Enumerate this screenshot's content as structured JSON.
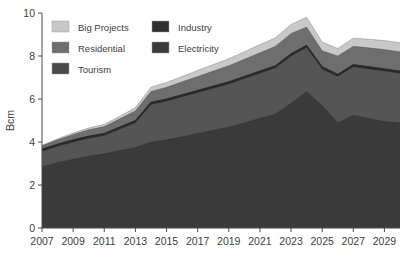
{
  "chart_data": {
    "type": "area",
    "stacked": true,
    "title": "",
    "xlabel": "",
    "ylabel": "Bcm",
    "ylim": [
      0,
      10
    ],
    "yticks": [
      0,
      2,
      4,
      6,
      8,
      10
    ],
    "ytick_labels": [
      "0",
      "2",
      "4",
      "6",
      "8",
      "10"
    ],
    "xlim": [
      2007,
      2030
    ],
    "xticks": [
      2007,
      2009,
      2011,
      2013,
      2015,
      2017,
      2019,
      2021,
      2023,
      2025,
      2027,
      2029
    ],
    "xtick_labels": [
      "2007",
      "2009",
      "2011",
      "2013",
      "2015",
      "2017",
      "2019",
      "2021",
      "2023",
      "2025",
      "2027",
      "2029"
    ],
    "x": [
      2007,
      2008,
      2009,
      2010,
      2011,
      2012,
      2013,
      2014,
      2015,
      2016,
      2017,
      2018,
      2019,
      2020,
      2021,
      2022,
      2023,
      2024,
      2025,
      2026,
      2027,
      2028,
      2029,
      2030
    ],
    "grid": false,
    "legend_position": "upper-left",
    "series": [
      {
        "name": "Electricity",
        "color": "#3a3a3a",
        "values": [
          2.85,
          3.05,
          3.2,
          3.35,
          3.45,
          3.6,
          3.75,
          4.0,
          4.1,
          4.25,
          4.4,
          4.55,
          4.7,
          4.9,
          5.1,
          5.3,
          5.8,
          6.35,
          5.7,
          4.9,
          5.25,
          5.1,
          4.95,
          4.9
        ]
      },
      {
        "name": "Tourism",
        "color": "#555555",
        "values": [
          0.72,
          0.75,
          0.8,
          0.82,
          0.85,
          1.0,
          1.15,
          1.75,
          1.8,
          1.85,
          1.9,
          1.95,
          2.0,
          2.05,
          2.1,
          2.15,
          2.2,
          2.05,
          1.7,
          2.15,
          2.25,
          2.3,
          2.35,
          2.3
        ]
      },
      {
        "name": "Industry",
        "color": "#2b2b2b",
        "values": [
          0.1,
          0.1,
          0.1,
          0.1,
          0.1,
          0.1,
          0.1,
          0.1,
          0.1,
          0.1,
          0.1,
          0.1,
          0.1,
          0.1,
          0.1,
          0.1,
          0.1,
          0.1,
          0.1,
          0.1,
          0.1,
          0.1,
          0.1,
          0.1
        ]
      },
      {
        "name": "Residential",
        "color": "#6e6e6e",
        "values": [
          0.15,
          0.2,
          0.25,
          0.3,
          0.32,
          0.38,
          0.45,
          0.5,
          0.55,
          0.6,
          0.65,
          0.7,
          0.75,
          0.8,
          0.85,
          0.9,
          0.95,
          0.85,
          0.75,
          0.85,
          0.85,
          0.88,
          0.9,
          0.9
        ]
      },
      {
        "name": "Big Projects",
        "color": "#c8c8c8",
        "values": [
          0.03,
          0.05,
          0.07,
          0.08,
          0.1,
          0.12,
          0.15,
          0.2,
          0.22,
          0.25,
          0.28,
          0.3,
          0.32,
          0.35,
          0.38,
          0.4,
          0.42,
          0.45,
          0.4,
          0.35,
          0.38,
          0.4,
          0.42,
          0.42
        ]
      }
    ],
    "totals": [
      3.85,
      4.15,
      4.42,
      4.65,
      4.82,
      5.2,
      5.6,
      6.55,
      6.77,
      7.05,
      7.33,
      7.6,
      7.87,
      8.2,
      8.53,
      8.85,
      9.47,
      9.8,
      8.65,
      8.35,
      8.83,
      8.78,
      8.72,
      8.62
    ]
  },
  "legend": {
    "entries": [
      {
        "label": "Big Projects",
        "color": "#c8c8c8",
        "row": 0,
        "col": 0
      },
      {
        "label": "Industry",
        "color": "#2f2f2f",
        "row": 0,
        "col": 1
      },
      {
        "label": "Residential",
        "color": "#6e6e6e",
        "row": 1,
        "col": 0
      },
      {
        "label": "Electricity",
        "color": "#3a3a3a",
        "row": 1,
        "col": 1
      },
      {
        "label": "Tourism",
        "color": "#4a4a4a",
        "row": 2,
        "col": 0
      }
    ]
  },
  "axes": {
    "y_title": "Bcm"
  }
}
